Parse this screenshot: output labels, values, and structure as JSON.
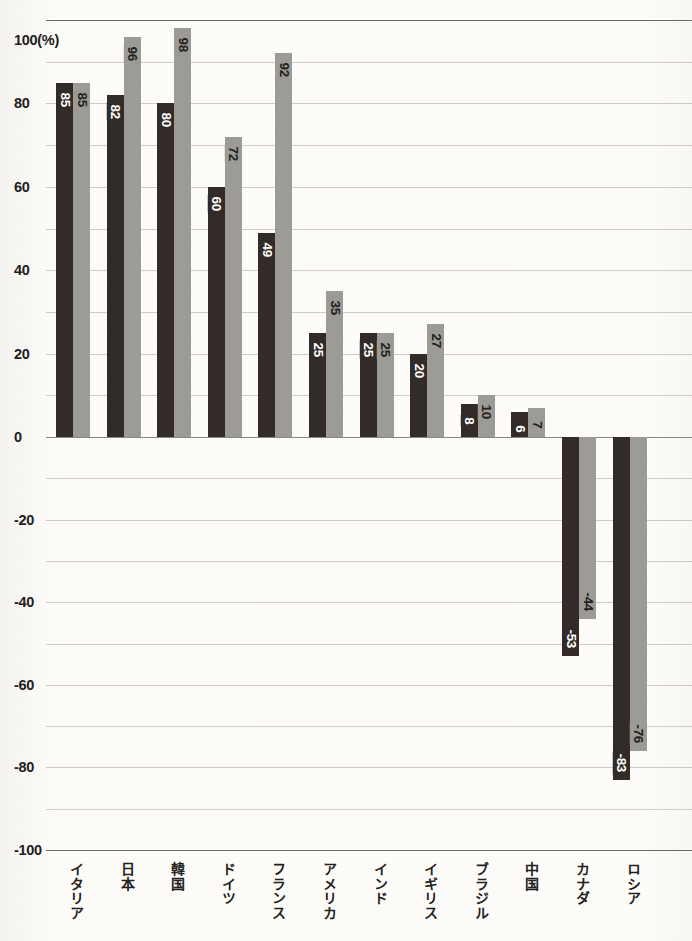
{
  "chart_data": {
    "type": "bar",
    "title": "",
    "subtitle": "",
    "xlabel": "",
    "ylabel": "",
    "unit_label": "100(%)",
    "ylim": [
      -100,
      100
    ],
    "ytick_values": [
      100,
      80,
      60,
      40,
      20,
      0,
      -20,
      -40,
      -60,
      -80,
      -100
    ],
    "ytick_labels": [
      "100(%)",
      "80",
      "60",
      "40",
      "20",
      "0",
      "-20",
      "-40",
      "-60",
      "-80",
      "-100"
    ],
    "grid": true,
    "grid_step": 10,
    "legend": [],
    "legend_position": "none",
    "categories": [
      "イタリア",
      "日本",
      "韓国",
      "ドイツ",
      "フランス",
      "アメリカ",
      "インド",
      "イギリス",
      "ブラジル",
      "中国",
      "カナダ",
      "ロシア"
    ],
    "series": [
      {
        "name": "series-1",
        "color": "#332b27",
        "values": [
          85,
          82,
          80,
          60,
          49,
          25,
          25,
          20,
          8,
          6,
          -53,
          -83
        ]
      },
      {
        "name": "series-2",
        "color": "#9c9b95",
        "values": [
          85,
          96,
          98,
          72,
          92,
          35,
          25,
          27,
          10,
          7,
          -44,
          -76
        ]
      }
    ]
  },
  "colors": {
    "background": "#fdfcf8",
    "series_dark": "#332b27",
    "series_light": "#9c9b95",
    "gridline": "#cfcdc6",
    "gridline_major": "#6e6c66",
    "text": "#23201d"
  }
}
